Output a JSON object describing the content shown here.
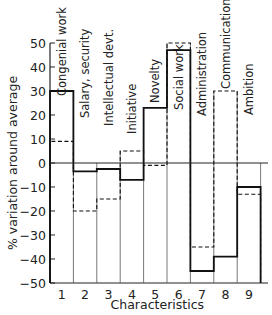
{
  "chart_data": {
    "type": "bar",
    "style": "step-histogram",
    "title": "",
    "xlabel": "Characteristics",
    "ylabel": "% variation around average",
    "ylim": [
      -50,
      50
    ],
    "yticks": [
      -50,
      -40,
      -30,
      -20,
      -10,
      0,
      10,
      20,
      30,
      40,
      50
    ],
    "categories": [
      "1",
      "2",
      "3",
      "4",
      "5",
      "6",
      "7",
      "8",
      "9"
    ],
    "category_names": [
      "Congenial work",
      "Salary, security",
      "Intellectual devt.",
      "Initiative",
      "Novelty",
      "Social work",
      "Administration",
      "Communications",
      "Ambition"
    ],
    "series": [
      {
        "name": "solid",
        "line_style": "solid",
        "values": [
          30,
          -3.5,
          -2.5,
          -7,
          23,
          47,
          -45,
          -39,
          -10
        ]
      },
      {
        "name": "dashed",
        "line_style": "dashed",
        "values": [
          9,
          -20,
          -15,
          5,
          -1,
          50,
          -35,
          30,
          -13
        ]
      }
    ],
    "grid": false,
    "legend": null
  }
}
